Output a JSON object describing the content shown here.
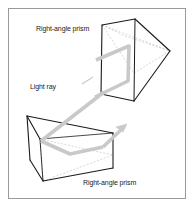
{
  "figure": {
    "background_color": "#ffffff",
    "frame_color": "#9a9a9a",
    "edge_color": "#1a1a1a",
    "hidden_edge_color": "#b0b0b0",
    "ray_color": "#c9c9c9",
    "ray_width": 4
  },
  "labels": {
    "top_prism": "Right-angle prism",
    "light_ray": "Light ray",
    "bottom_prism": "Right-angle prism"
  },
  "diagram_data": {
    "type": "diagram",
    "subject": "optics",
    "description": "Two right-angle prisms shown in perspective. A light ray enters the lower-left prism, reflects internally, travels diagonally upward to the upper-right prism, reflects again and exits.",
    "components": [
      {
        "name": "upper-right-prism",
        "label": "Right-angle prism",
        "position": "upper-right"
      },
      {
        "name": "lower-left-prism",
        "label": "Right-angle prism",
        "position": "lower-left"
      },
      {
        "name": "light-ray",
        "label": "Light ray",
        "path": "enters lower prism, reflects, travels up-right to upper prism, reflects, exits"
      }
    ],
    "arrow_count": 1,
    "arrow_direction": "up-right"
  }
}
